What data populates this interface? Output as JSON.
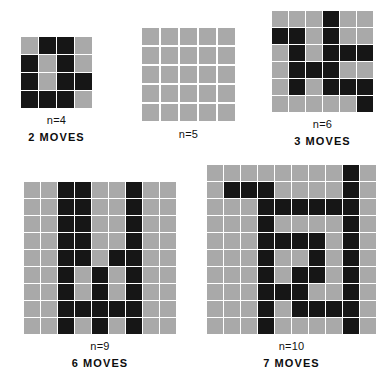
{
  "figure": {
    "colors": {
      "background": "#ffffff",
      "empty_cell": "#a9a9a9",
      "filled_cell": "#161616",
      "gridline": "#ffffff",
      "text": "#111111"
    }
  },
  "panels": [
    {
      "id": "panel-n4",
      "order_label": "n=4",
      "moves_label": "2 MOVES",
      "n": 4,
      "rows": 4,
      "cols": 4,
      "cell_px": 17,
      "gap_px": 1,
      "left_px": 19,
      "top_px": 35,
      "grid": [
        [
          0,
          1,
          1,
          0
        ],
        [
          1,
          0,
          1,
          0
        ],
        [
          1,
          0,
          1,
          1
        ],
        [
          1,
          1,
          1,
          0
        ]
      ]
    },
    {
      "id": "panel-n5",
      "order_label": "n=5",
      "moves_label": "",
      "n": 5,
      "rows": 5,
      "cols": 5,
      "cell_px": 17,
      "gap_px": 2,
      "left_px": 139,
      "top_px": 25,
      "grid": [
        [
          0,
          0,
          0,
          0,
          0
        ],
        [
          0,
          0,
          0,
          0,
          0
        ],
        [
          0,
          0,
          0,
          0,
          0
        ],
        [
          0,
          0,
          0,
          0,
          0
        ],
        [
          0,
          0,
          0,
          0,
          0
        ]
      ]
    },
    {
      "id": "panel-n6",
      "order_label": "n=6",
      "moves_label": "3 MOVES",
      "n": 6,
      "rows": 6,
      "cols": 6,
      "cell_px": 16,
      "gap_px": 1,
      "left_px": 270,
      "top_px": 9,
      "grid": [
        [
          0,
          0,
          0,
          1,
          0,
          0
        ],
        [
          1,
          1,
          0,
          1,
          0,
          0
        ],
        [
          0,
          1,
          0,
          1,
          1,
          1
        ],
        [
          0,
          1,
          1,
          1,
          0,
          0
        ],
        [
          0,
          1,
          0,
          1,
          1,
          1
        ],
        [
          0,
          0,
          0,
          0,
          0,
          1
        ]
      ]
    },
    {
      "id": "panel-n9",
      "order_label": "n=9",
      "moves_label": "6 MOVES",
      "n": 9,
      "rows": 9,
      "cols": 9,
      "cell_px": 16,
      "gap_px": 1,
      "left_px": 22,
      "top_px": 180,
      "grid": [
        [
          0,
          0,
          1,
          1,
          0,
          0,
          1,
          0,
          0
        ],
        [
          0,
          0,
          1,
          1,
          0,
          0,
          1,
          0,
          0
        ],
        [
          0,
          0,
          1,
          1,
          0,
          0,
          1,
          0,
          0
        ],
        [
          0,
          0,
          1,
          1,
          0,
          0,
          1,
          0,
          0
        ],
        [
          0,
          0,
          1,
          1,
          0,
          1,
          1,
          0,
          0
        ],
        [
          0,
          0,
          1,
          0,
          1,
          0,
          1,
          0,
          0
        ],
        [
          0,
          0,
          1,
          0,
          1,
          0,
          1,
          0,
          0
        ],
        [
          0,
          0,
          1,
          1,
          1,
          1,
          1,
          0,
          0
        ],
        [
          0,
          0,
          1,
          0,
          1,
          0,
          1,
          0,
          0
        ]
      ]
    },
    {
      "id": "panel-n10",
      "order_label": "n=10",
      "moves_label": "7 MOVES",
      "n": 10,
      "rows": 10,
      "cols": 10,
      "cell_px": 16,
      "gap_px": 1,
      "left_px": 205,
      "top_px": 163,
      "grid": [
        [
          0,
          0,
          0,
          0,
          0,
          0,
          0,
          0,
          1,
          0
        ],
        [
          0,
          1,
          1,
          1,
          0,
          0,
          0,
          0,
          1,
          0
        ],
        [
          0,
          0,
          0,
          1,
          1,
          1,
          1,
          1,
          1,
          0
        ],
        [
          0,
          0,
          0,
          1,
          0,
          0,
          0,
          0,
          1,
          0
        ],
        [
          0,
          0,
          0,
          1,
          1,
          1,
          1,
          0,
          1,
          0
        ],
        [
          0,
          0,
          0,
          1,
          0,
          0,
          1,
          0,
          1,
          0
        ],
        [
          0,
          0,
          0,
          1,
          0,
          1,
          1,
          0,
          1,
          0
        ],
        [
          0,
          0,
          0,
          1,
          1,
          1,
          0,
          0,
          1,
          0
        ],
        [
          0,
          0,
          0,
          1,
          0,
          1,
          1,
          1,
          1,
          0
        ],
        [
          0,
          0,
          0,
          1,
          0,
          0,
          0,
          0,
          1,
          0
        ]
      ]
    }
  ]
}
